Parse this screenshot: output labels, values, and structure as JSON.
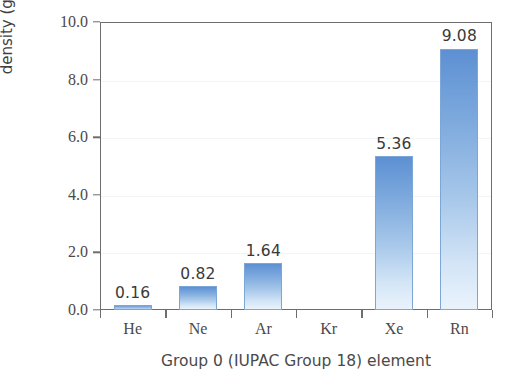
{
  "chart_data": {
    "type": "bar",
    "title": "",
    "xlabel": "Group 0 (IUPAC Group 18) element",
    "ylabel": "density (g/dm3)",
    "ylabel_base": "density (g/dm",
    "ylabel_exp": "3",
    "ylabel_close": ")",
    "categories": [
      "He",
      "Ne",
      "Ar",
      "Kr",
      "Xe",
      "Rn"
    ],
    "values": [
      0.16,
      0.82,
      1.64,
      null,
      5.36,
      9.08
    ],
    "value_labels": [
      "0.16",
      "0.82",
      "1.64",
      "",
      "5.36",
      "9.08"
    ],
    "ylim": [
      0.0,
      10.0
    ],
    "ytick_values": [
      0.0,
      2.0,
      4.0,
      6.0,
      8.0,
      10.0
    ],
    "ytick_labels": [
      "0.0",
      "2.0",
      "4.0",
      "6.0",
      "8.0",
      "10.0"
    ],
    "grid": true,
    "grid_axis": "y",
    "legend": false,
    "bar_color_top": "#5d90d3",
    "bar_color_bottom": "#eaf3fc",
    "bar_edge_color": "#7ba6d6",
    "axis_color": "#6e6e6e",
    "grid_color": "#f2f4f7",
    "text_color": "#4a4a4a",
    "background": "#ffffff"
  }
}
